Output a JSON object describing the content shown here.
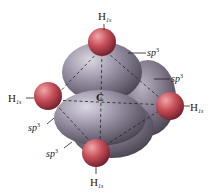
{
  "diagram": {
    "center_atom": {
      "label": "C"
    },
    "hydrogen_labels": [
      {
        "position": "top",
        "label": "H",
        "subscript": "1s"
      },
      {
        "position": "left",
        "label": "H",
        "subscript": "1s"
      },
      {
        "position": "right",
        "label": "H",
        "subscript": "1s"
      },
      {
        "position": "bottom",
        "label": "H",
        "subscript": "1s"
      }
    ],
    "orbital_labels": [
      {
        "position": "upper-right",
        "label": "sp",
        "superscript": "3"
      },
      {
        "position": "right",
        "label": "sp",
        "superscript": "3"
      },
      {
        "position": "lower-left",
        "label": "sp",
        "superscript": "3"
      },
      {
        "position": "bottom-left",
        "label": "sp",
        "superscript": "3"
      }
    ],
    "colors": {
      "sp3_lobe": "#8e8798",
      "sp3_lobe_highlight": "#d8d4de",
      "sp3_lobe_shadow": "#4a4452",
      "h1s_sphere": "#c8505a",
      "h1s_highlight": "#eea0a4",
      "h1s_shadow": "#7a2430",
      "bond_lines": "#222222"
    }
  }
}
